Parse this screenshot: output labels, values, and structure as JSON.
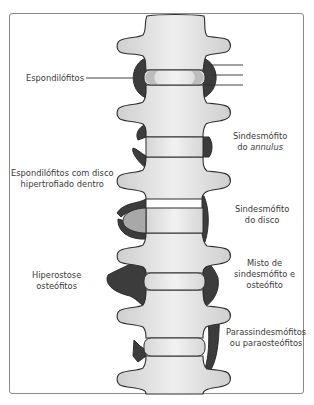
{
  "figure": {
    "title": "",
    "colors": {
      "bone_fill": "#dcdcdc",
      "bone_highlight": "#f0f0f0",
      "outline": "#2e2e2e",
      "osteophyte": "#3c3c3c",
      "disc_fill": "#e4e4e4",
      "hypertrophied_disc": "#a8a8a8",
      "annulus_ring": "#bdbdbd",
      "frame": "#8a8a8a",
      "text": "#3a3a3a"
    },
    "labels": {
      "espondilofitos": "Espondilófitos",
      "sindesmofito_annulus_line1": "Sindesmófito",
      "sindesmofito_annulus_line2_prefix": "do ",
      "sindesmofito_annulus_line2_italic": "annulus",
      "espondilofitos_disco_line1": "Espondilófitos com disco",
      "espondilofitos_disco_line2": "hipertrofiado dentro",
      "sindesmofito_disco_line1": "Sindesmófito",
      "sindesmofito_disco_line2": "do disco",
      "hiperostose_line1": "Hiperostose",
      "hiperostose_line2": "osteófitos",
      "misto_line1": "Misto de",
      "misto_line2": "sindesmófito e",
      "misto_line3": "osteófito",
      "parassindesmofitos_line1": "Parassindesmófitos",
      "parassindesmofitos_line2": "ou paraosteófitos"
    }
  }
}
